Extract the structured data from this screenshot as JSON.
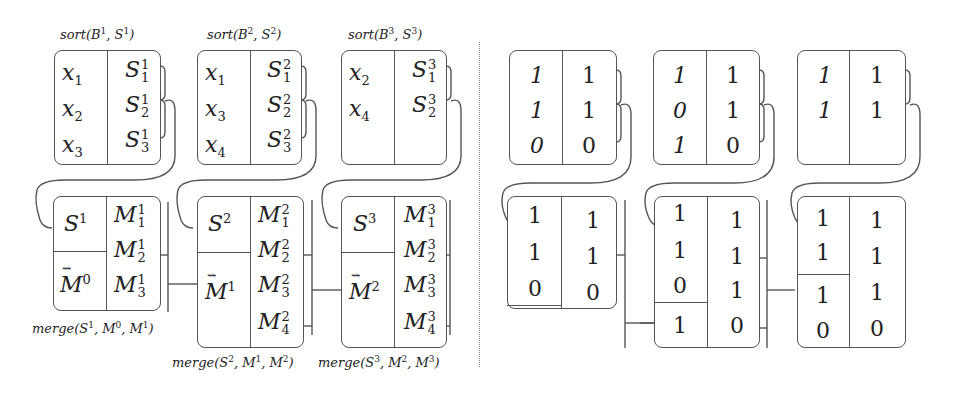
{
  "left_panel": {
    "sort_blocks": [
      {
        "caption": "sort(B1, S1)",
        "caption_base": "sort(B",
        "b_sup": "1",
        "s_sup": "1",
        "keys": [
          {
            "var": "x",
            "sub": "1"
          },
          {
            "var": "x",
            "sub": "2"
          },
          {
            "var": "x",
            "sub": "3"
          }
        ],
        "sums": [
          {
            "var": "S",
            "sup": "1",
            "sub": "1"
          },
          {
            "var": "S",
            "sup": "1",
            "sub": "2"
          },
          {
            "var": "S",
            "sup": "1",
            "sub": "3"
          }
        ]
      },
      {
        "caption": "sort(B2, S2)",
        "caption_base": "sort(B",
        "b_sup": "2",
        "s_sup": "2",
        "keys": [
          {
            "var": "x",
            "sub": "1"
          },
          {
            "var": "x",
            "sub": "3"
          },
          {
            "var": "x",
            "sub": "4"
          }
        ],
        "sums": [
          {
            "var": "S",
            "sup": "2",
            "sub": "1"
          },
          {
            "var": "S",
            "sup": "2",
            "sub": "2"
          },
          {
            "var": "S",
            "sup": "2",
            "sub": "3"
          }
        ]
      },
      {
        "caption": "sort(B3, S3)",
        "caption_base": "sort(B",
        "b_sup": "3",
        "s_sup": "3",
        "keys": [
          {
            "var": "x",
            "sub": "2"
          },
          {
            "var": "x",
            "sub": "4"
          }
        ],
        "sums": [
          {
            "var": "S",
            "sup": "3",
            "sub": "1"
          },
          {
            "var": "S",
            "sup": "3",
            "sub": "2"
          }
        ]
      }
    ],
    "merge_blocks": [
      {
        "caption": "merge(S1, M0, M1)",
        "s_label": "S",
        "s_sup": "1",
        "m_label": "M",
        "m_sup": "0",
        "outputs": [
          {
            "var": "M",
            "sup": "1",
            "sub": "1"
          },
          {
            "var": "M",
            "sup": "1",
            "sub": "2"
          },
          {
            "var": "M",
            "sup": "1",
            "sub": "3"
          }
        ]
      },
      {
        "caption": "merge(S2, M1, M2)",
        "s_label": "S",
        "s_sup": "2",
        "m_label": "M",
        "m_sup": "1",
        "outputs": [
          {
            "var": "M",
            "sup": "2",
            "sub": "1"
          },
          {
            "var": "M",
            "sup": "2",
            "sub": "2"
          },
          {
            "var": "M",
            "sup": "2",
            "sub": "3"
          },
          {
            "var": "M",
            "sup": "2",
            "sub": "4"
          }
        ]
      },
      {
        "caption": "merge(S3, M2, M3)",
        "s_label": "S",
        "s_sup": "3",
        "m_label": "M",
        "m_sup": "2",
        "outputs": [
          {
            "var": "M",
            "sup": "3",
            "sub": "1"
          },
          {
            "var": "M",
            "sup": "3",
            "sub": "2"
          },
          {
            "var": "M",
            "sup": "3",
            "sub": "3"
          },
          {
            "var": "M",
            "sup": "3",
            "sub": "4"
          }
        ]
      }
    ],
    "captions": {
      "sort_prefix": "sort(",
      "merge_prefix": "merge(",
      "comma": ", ",
      "close": ")",
      "tilde": "⇝"
    }
  },
  "right_panel": {
    "sort_blocks": [
      {
        "left": [
          "1",
          "1",
          "0"
        ],
        "right": [
          "1",
          "1",
          "0"
        ]
      },
      {
        "left": [
          "1",
          "0",
          "1"
        ],
        "right": [
          "1",
          "1",
          "0"
        ]
      },
      {
        "left": [
          "1",
          "1"
        ],
        "right": [
          "1",
          "1"
        ]
      }
    ],
    "merge_blocks": [
      {
        "top": [
          "1",
          "1",
          "0"
        ],
        "bottom": [],
        "right": [
          "1",
          "1",
          "0"
        ]
      },
      {
        "top": [
          "1",
          "1",
          "0"
        ],
        "bottom": [
          "1"
        ],
        "right": [
          "1",
          "1",
          "1",
          "0"
        ]
      },
      {
        "top": [
          "1",
          "1"
        ],
        "bottom": [
          "1",
          "0"
        ],
        "right": [
          "1",
          "1",
          "1",
          "0"
        ]
      }
    ]
  },
  "colors": {
    "stroke": "#555555",
    "text": "#222222",
    "divider": "#888888",
    "background": "#ffffff"
  }
}
